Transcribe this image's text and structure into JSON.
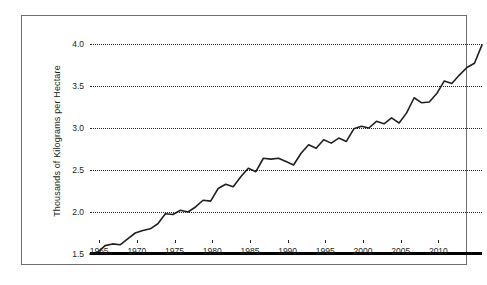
{
  "chart_data": {
    "type": "line",
    "title": "",
    "xlabel": "",
    "ylabel": "Thousands of Kilograms per Hectare",
    "xlim": [
      1961,
      2013
    ],
    "ylim": [
      1.5,
      4.0
    ],
    "grid": true,
    "legend": "none",
    "yticks": [
      "1.5",
      "2.0",
      "2.5",
      "3.0",
      "3.5",
      "4.0"
    ],
    "ytick_values": [
      1.5,
      2.0,
      2.5,
      3.0,
      3.5,
      4.0
    ],
    "xticks": [
      "1965",
      "1970",
      "1975",
      "1980",
      "1985",
      "1990",
      "1995",
      "2000",
      "2005",
      "2010"
    ],
    "xtick_values": [
      1965,
      1970,
      1975,
      1980,
      1985,
      1990,
      1995,
      2000,
      2005,
      2010
    ],
    "series": [
      {
        "name": "Cereal yield",
        "color": "#231f20",
        "x": [
          1961,
          1962,
          1963,
          1964,
          1965,
          1966,
          1967,
          1968,
          1969,
          1970,
          1971,
          1972,
          1973,
          1974,
          1975,
          1976,
          1977,
          1978,
          1979,
          1980,
          1981,
          1982,
          1983,
          1984,
          1985,
          1986,
          1987,
          1988,
          1989,
          1990,
          1991,
          1992,
          1993,
          1994,
          1995,
          1996,
          1997,
          1998,
          1999,
          2000,
          2001,
          2002,
          2003,
          2004,
          2005,
          2006,
          2007,
          2008,
          2009,
          2010,
          2011,
          2012,
          2013
        ],
        "values": [
          1.5,
          1.52,
          1.6,
          1.62,
          1.61,
          1.68,
          1.75,
          1.78,
          1.8,
          1.86,
          1.98,
          1.97,
          2.02,
          2.0,
          2.06,
          2.14,
          2.13,
          2.28,
          2.33,
          2.3,
          2.42,
          2.52,
          2.48,
          2.64,
          2.63,
          2.64,
          2.6,
          2.56,
          2.7,
          2.8,
          2.76,
          2.86,
          2.82,
          2.88,
          2.84,
          2.99,
          3.02,
          3.0,
          3.08,
          3.05,
          3.12,
          3.06,
          3.18,
          3.36,
          3.3,
          3.31,
          3.41,
          3.56,
          3.53,
          3.63,
          3.72,
          3.77,
          3.99
        ]
      }
    ]
  },
  "axis": {
    "ylabel": "Thousands of Kilograms per Hectare"
  }
}
